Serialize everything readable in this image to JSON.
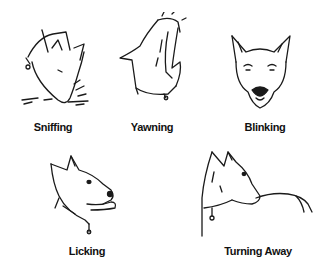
{
  "illustration": {
    "panels": [
      {
        "id": "sniffing",
        "label": "Sniffing",
        "icon": "dog-sniffing-icon"
      },
      {
        "id": "yawning",
        "label": "Yawning",
        "icon": "dog-yawning-icon"
      },
      {
        "id": "blinking",
        "label": "Blinking",
        "icon": "dog-blinking-icon"
      },
      {
        "id": "licking",
        "label": "Licking",
        "icon": "dog-licking-icon"
      },
      {
        "id": "turning-away",
        "label": "Turning Away",
        "icon": "dog-turning-away-icon"
      }
    ]
  }
}
